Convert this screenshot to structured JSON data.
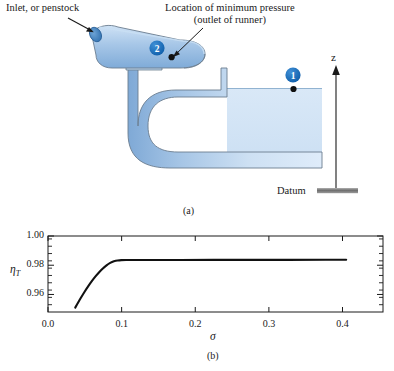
{
  "figure": {
    "panel_a": {
      "caption": "(a)",
      "labels": {
        "inlet": "Inlet, or penstock",
        "min_pressure_line1": "Location of minimum pressure",
        "min_pressure_line2": "(outlet of runner)",
        "z_axis": "z",
        "datum": "Datum",
        "point_2": "2",
        "point_1": "1"
      },
      "colors": {
        "water_light": "#dbe9f7",
        "water_mid": "#aecbe8",
        "water_dark": "#8cb4dd",
        "pipe_inlet_face": "#3f7fc0",
        "marker_circle": "#1769b5",
        "outline": "#5f6f80",
        "datum_bar": "#8a8a8a"
      }
    },
    "panel_b": {
      "caption": "(b)"
    }
  },
  "chart_data": {
    "type": "line",
    "title": "",
    "xlabel": "σ",
    "ylabel": "η_T",
    "xlim": [
      0.0,
      0.455
    ],
    "ylim": [
      0.948,
      1.0
    ],
    "xticks": [
      0.0,
      0.1,
      0.2,
      0.3,
      0.4
    ],
    "xticklabels": [
      "0.0",
      "0.1",
      "0.2",
      "0.3",
      "0.4"
    ],
    "yticks": [
      0.96,
      0.98,
      1.0
    ],
    "yticklabels": [
      "0.96",
      "0.98",
      "1.00"
    ],
    "yminor_step": 0.005,
    "grid": false,
    "legend": null,
    "series": [
      {
        "name": "turbine efficiency",
        "x": [
          0.037,
          0.042,
          0.047,
          0.052,
          0.057,
          0.062,
          0.067,
          0.072,
          0.077,
          0.082,
          0.087,
          0.092,
          0.097,
          0.102,
          0.11,
          0.13,
          0.16,
          0.2,
          0.25,
          0.3,
          0.35,
          0.405
        ],
        "y": [
          0.951,
          0.9554,
          0.9597,
          0.9637,
          0.9674,
          0.9708,
          0.9739,
          0.9766,
          0.979,
          0.9809,
          0.9823,
          0.9831,
          0.9834,
          0.98355,
          0.9836,
          0.9836,
          0.98362,
          0.98364,
          0.98366,
          0.98368,
          0.9837,
          0.98372
        ]
      }
    ]
  }
}
